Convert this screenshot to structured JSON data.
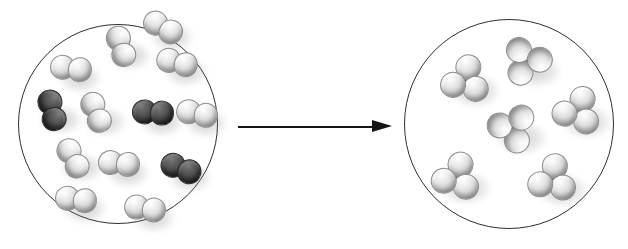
{
  "figure": {
    "background_color": "#ffffff",
    "outline_color": "#2e2e2e",
    "light_atom_color": "#e2e2e2",
    "dark_atom_color": "#3f3f3f"
  },
  "arrow": {
    "name": "reaction-arrow",
    "direction": "right",
    "label": "",
    "x1": 238,
    "y1": 127,
    "x2": 392,
    "y2": 127,
    "color": "#141414"
  },
  "chart_data": {
    "type": "diagram",
    "xlabel": "",
    "ylabel": "",
    "legend": [
      {
        "label": "light atom",
        "color": "#e2e2e2"
      },
      {
        "label": "dark atom",
        "color": "#3f3f3f"
      }
    ],
    "panels": [
      {
        "name": "reactants",
        "role": "reactants",
        "circle": {
          "cx": 118,
          "cy": 124,
          "r": 100
        },
        "molecule_counts": {
          "light_diatomic": 10,
          "dark_diatomic": 3,
          "total": 13
        },
        "molecules": [
          {
            "type": "light_diatomic",
            "atoms": 2,
            "color": "light",
            "x": 121,
            "y": 46,
            "angle": 72
          },
          {
            "type": "light_diatomic",
            "atoms": 2,
            "color": "light",
            "x": 71,
            "y": 68,
            "angle": 8
          },
          {
            "type": "light_diatomic",
            "atoms": 2,
            "color": "light",
            "x": 177,
            "y": 62,
            "angle": 14
          },
          {
            "type": "dark_diatomic",
            "atoms": 2,
            "color": "dark",
            "x": 52,
            "y": 110,
            "angle": 76
          },
          {
            "type": "light_diatomic",
            "atoms": 2,
            "color": "light",
            "x": 96,
            "y": 112,
            "angle": 68
          },
          {
            "type": "dark_diatomic",
            "atoms": 2,
            "color": "dark",
            "x": 153,
            "y": 112,
            "angle": 4
          },
          {
            "type": "light_diatomic",
            "atoms": 2,
            "color": "light",
            "x": 197,
            "y": 113,
            "angle": 12
          },
          {
            "type": "light_diatomic",
            "atoms": 2,
            "color": "light",
            "x": 73,
            "y": 158,
            "angle": 62
          },
          {
            "type": "light_diatomic",
            "atoms": 2,
            "color": "light",
            "x": 119,
            "y": 163,
            "angle": 6
          },
          {
            "type": "dark_diatomic",
            "atoms": 2,
            "color": "dark",
            "x": 181,
            "y": 168,
            "angle": 22
          },
          {
            "type": "light_diatomic",
            "atoms": 2,
            "color": "light",
            "x": 76,
            "y": 199,
            "angle": 8
          },
          {
            "type": "light_diatomic",
            "atoms": 2,
            "color": "light",
            "x": 145,
            "y": 208,
            "angle": 10
          },
          {
            "type": "light_diatomic",
            "atoms": 2,
            "color": "light",
            "x": 163,
            "y": 27,
            "angle": 30
          }
        ]
      },
      {
        "name": "products",
        "role": "products",
        "circle": {
          "cx": 509,
          "cy": 124,
          "r": 105
        },
        "molecule_counts": {
          "polyatomic": 6,
          "total": 6
        },
        "molecules": [
          {
            "type": "polyatomic",
            "atoms": 4,
            "color": "light-with-dark-core",
            "x": 466,
            "y": 81,
            "angle": 10
          },
          {
            "type": "polyatomic",
            "atoms": 4,
            "color": "light-with-dark-core",
            "x": 527,
            "y": 61,
            "angle": 205
          },
          {
            "type": "polyatomic",
            "atoms": 4,
            "color": "light-with-dark-core",
            "x": 578,
            "y": 112,
            "angle": 20
          },
          {
            "type": "polyatomic",
            "atoms": 4,
            "color": "light-with-dark-core",
            "x": 513,
            "y": 128,
            "angle": 160
          },
          {
            "type": "polyatomic",
            "atoms": 4,
            "color": "light-with-dark-core",
            "x": 457,
            "y": 178,
            "angle": 15
          },
          {
            "type": "polyatomic",
            "atoms": 4,
            "color": "light-with-dark-core",
            "x": 553,
            "y": 180,
            "angle": 8
          }
        ]
      }
    ]
  }
}
